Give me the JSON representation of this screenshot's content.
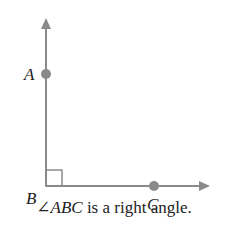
{
  "diagram": {
    "type": "geometry-angle",
    "vertex": {
      "label": "B"
    },
    "points": [
      {
        "label": "A",
        "on": "ray BA (vertical, upward)"
      },
      {
        "label": "C",
        "on": "ray BC (horizontal, rightward)"
      }
    ],
    "right_angle_marker": true,
    "colors": {
      "ray": "#8a8a8a",
      "point": "#8a8a8a",
      "text": "#222222"
    }
  },
  "labels": {
    "A": "A",
    "B": "B",
    "C": "C"
  },
  "caption": {
    "angle_symbol": "∠",
    "angle_name": "ABC",
    "text": " is a right angle."
  }
}
